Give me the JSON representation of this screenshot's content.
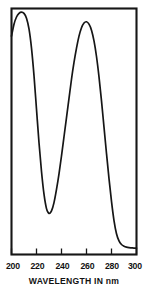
{
  "chart_data": {
    "type": "line",
    "title": "",
    "xlabel": "WAVELENGTH IN nm",
    "ylabel": "",
    "xlim": [
      200,
      300
    ],
    "ylim": [
      0,
      1
    ],
    "grid": false,
    "legend": null,
    "xticks": [
      200,
      220,
      240,
      260,
      280,
      300
    ],
    "xtick_labels": [
      "200",
      "220",
      "240",
      "260",
      "280",
      "300"
    ],
    "yticks": [],
    "ytick_labels": [],
    "annotations": [],
    "series": [
      {
        "name": "absorbance",
        "x": [
          200,
          202,
          204,
          206,
          208,
          210,
          212,
          214,
          216,
          218,
          220,
          222,
          224,
          226,
          228,
          230,
          232,
          234,
          236,
          238,
          240,
          242,
          244,
          246,
          248,
          250,
          252,
          254,
          256,
          258,
          260,
          262,
          264,
          266,
          268,
          270,
          272,
          274,
          276,
          278,
          280,
          282,
          284,
          286,
          288,
          290,
          292,
          294,
          296,
          298,
          300
        ],
        "y": [
          0.895,
          0.945,
          0.975,
          0.99,
          0.995,
          0.99,
          0.97,
          0.925,
          0.845,
          0.73,
          0.59,
          0.45,
          0.33,
          0.235,
          0.175,
          0.155,
          0.165,
          0.2,
          0.255,
          0.32,
          0.395,
          0.475,
          0.555,
          0.635,
          0.715,
          0.785,
          0.845,
          0.895,
          0.93,
          0.95,
          0.955,
          0.945,
          0.92,
          0.875,
          0.81,
          0.725,
          0.625,
          0.515,
          0.405,
          0.3,
          0.205,
          0.125,
          0.07,
          0.04,
          0.025,
          0.018,
          0.014,
          0.012,
          0.011,
          0.01,
          0.01
        ]
      }
    ],
    "peaks": [
      {
        "label": "peak-1",
        "x": 208,
        "y": 0.995
      },
      {
        "label": "peak-2",
        "x": 260,
        "y": 0.955
      }
    ],
    "minima": [
      {
        "label": "trough",
        "x": 230,
        "y": 0.155
      }
    ]
  }
}
